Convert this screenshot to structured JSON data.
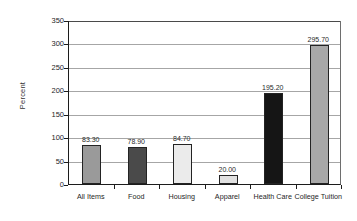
{
  "chart_data": {
    "type": "bar",
    "title": "",
    "xlabel": "",
    "ylabel": "Percent",
    "categories": [
      "All Items",
      "Food",
      "Housing",
      "Apparel",
      "Health Care",
      "College Tuition"
    ],
    "values": [
      83.3,
      78.9,
      84.7,
      20.0,
      195.2,
      295.7
    ],
    "value_labels": [
      "83.30",
      "78.90",
      "84.70",
      "20.00",
      "195.20",
      "295.70"
    ],
    "bar_colors": [
      "#9a9a9a",
      "#4a4a4a",
      "#ebebeb",
      "#e0e0e0",
      "#151515",
      "#a8a8a8"
    ],
    "ylim": [
      0,
      350
    ],
    "ytick_step": 50,
    "ytick_labels": [
      "0",
      "50",
      "100",
      "150",
      "200",
      "250",
      "300",
      "350"
    ],
    "grid": "horizontal",
    "legend": "none"
  },
  "axis": {
    "y_title": "Percent"
  }
}
